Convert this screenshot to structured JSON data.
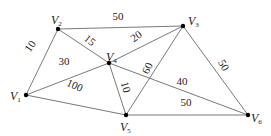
{
  "diagram": {
    "type": "weighted-graph",
    "nodes": [
      {
        "id": "V1",
        "letter": "V",
        "sub": "1",
        "x": 26,
        "y": 95,
        "lx": 10,
        "ly": 100
      },
      {
        "id": "V2",
        "letter": "V",
        "sub": "2",
        "x": 58,
        "y": 29,
        "lx": 51,
        "ly": 24
      },
      {
        "id": "V3",
        "letter": "V",
        "sub": "3",
        "x": 183,
        "y": 26,
        "lx": 188,
        "ly": 25
      },
      {
        "id": "V4",
        "letter": "V",
        "sub": "4",
        "x": 109,
        "y": 63,
        "lx": 106,
        "ly": 61
      },
      {
        "id": "V5",
        "letter": "V",
        "sub": "5",
        "x": 126,
        "y": 115,
        "lx": 120,
        "ly": 131
      },
      {
        "id": "V6",
        "letter": "V",
        "sub": "6",
        "x": 248,
        "y": 115,
        "lx": 251,
        "ly": 122
      }
    ],
    "edges": [
      {
        "from": "V1",
        "to": "V2",
        "weight": "10",
        "lx": 30,
        "ly": 50,
        "rot": -55
      },
      {
        "from": "V2",
        "to": "V3",
        "weight": "50",
        "lx": 118,
        "ly": 20,
        "rot": 0
      },
      {
        "from": "V2",
        "to": "V4",
        "weight": "15",
        "lx": 90,
        "ly": 44,
        "rot": 40
      },
      {
        "from": "V1",
        "to": "V4",
        "weight": "30",
        "lx": 64,
        "ly": 65,
        "rot": 0
      },
      {
        "from": "V4",
        "to": "V3",
        "weight": "20",
        "lx": 136,
        "ly": 40,
        "rot": -35
      },
      {
        "from": "V5",
        "to": "V3",
        "weight": "60",
        "lx": 147,
        "ly": 72,
        "rot": -65
      },
      {
        "from": "V1",
        "to": "V5",
        "weight": "100",
        "lx": 75,
        "ly": 89,
        "rot": 25
      },
      {
        "from": "V4",
        "to": "V5",
        "weight": "10",
        "lx": 126,
        "ly": 91,
        "rot": 75
      },
      {
        "from": "V4",
        "to": "V6",
        "weight": "40",
        "lx": 182,
        "ly": 85,
        "rot": 0
      },
      {
        "from": "V5",
        "to": "V6",
        "weight": "50",
        "lx": 186,
        "ly": 106,
        "rot": 0
      },
      {
        "from": "V3",
        "to": "V6",
        "weight": "50",
        "lx": 224,
        "ly": 69,
        "rot": 60
      }
    ]
  }
}
